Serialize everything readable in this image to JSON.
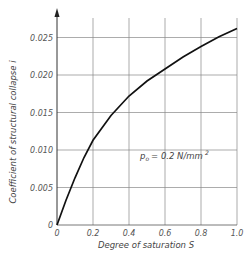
{
  "chart_data": {
    "type": "line",
    "title": "",
    "xlabel": "Degree of saturation S",
    "ylabel": "Coefficient of structural collapse  i",
    "x_ticks": [
      "0",
      "0.2",
      "0.4",
      "0.6",
      "0.8",
      "1.0"
    ],
    "y_ticks": [
      "0",
      "0.005",
      "0.010",
      "0.015",
      "0.020",
      "0.025"
    ],
    "xlim": [
      0,
      1.0
    ],
    "ylim": [
      0,
      0.025
    ],
    "grid": true,
    "legend": null,
    "annotations": [
      {
        "text_main": "p",
        "text_sub": "o",
        "text_rest": "= 0.2  N/mm",
        "text_sup": "2"
      }
    ],
    "series": [
      {
        "name": "p0 = 0.2 N/mm2",
        "x": [
          0,
          0.05,
          0.1,
          0.15,
          0.2,
          0.3,
          0.4,
          0.5,
          0.6,
          0.7,
          0.8,
          0.9,
          1.0
        ],
        "y": [
          0,
          0.0033,
          0.0063,
          0.009,
          0.0113,
          0.0146,
          0.0172,
          0.0192,
          0.0208,
          0.0224,
          0.0238,
          0.0251,
          0.0262
        ]
      }
    ]
  }
}
